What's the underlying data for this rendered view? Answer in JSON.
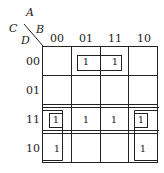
{
  "kmap": {
    "row_var_labels": [
      "C",
      "D"
    ],
    "col_var_labels": [
      "A",
      "B"
    ],
    "columns": [
      "00",
      "01",
      "11",
      "10"
    ],
    "rows": [
      "00",
      "01",
      "11",
      "10"
    ],
    "cells": [
      [
        "",
        "1",
        "1",
        ""
      ],
      [
        "",
        "",
        "",
        ""
      ],
      [
        "1",
        "1",
        "1",
        "1"
      ],
      [
        "1",
        "",
        "",
        "1"
      ]
    ],
    "groups": [
      {
        "name": "row00-cols01-11",
        "cells": [
          [
            0,
            1
          ],
          [
            0,
            2
          ]
        ]
      },
      {
        "name": "row11-all",
        "cells": [
          [
            2,
            0
          ],
          [
            2,
            1
          ],
          [
            2,
            2
          ],
          [
            2,
            3
          ]
        ]
      },
      {
        "name": "col00-rows11-10",
        "cells": [
          [
            2,
            0
          ],
          [
            3,
            0
          ]
        ]
      },
      {
        "name": "col10-rows11-10",
        "cells": [
          [
            2,
            3
          ],
          [
            3,
            3
          ]
        ]
      },
      {
        "name": "cell-11-00",
        "cells": [
          [
            2,
            0
          ]
        ]
      },
      {
        "name": "cell-11-10",
        "cells": [
          [
            2,
            3
          ]
        ]
      }
    ]
  }
}
